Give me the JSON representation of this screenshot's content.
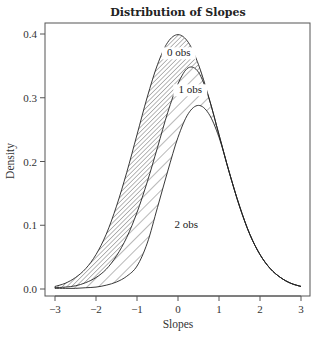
{
  "chart_data": {
    "type": "area",
    "title": "Distribution of Slopes",
    "xlabel": "Slopes",
    "ylabel": "Density",
    "xlim": [
      -3.25,
      3.2
    ],
    "ylim": [
      -0.005,
      0.415
    ],
    "xticks": [
      -3,
      -2,
      -1,
      0,
      1,
      2,
      3
    ],
    "xtick_labels": [
      "−3",
      "−2",
      "−1",
      "0",
      "1",
      "2",
      "3"
    ],
    "yticks": [
      0.0,
      0.1,
      0.2,
      0.3,
      0.4
    ],
    "ytick_labels": [
      "0.0",
      "0.1",
      "0.2",
      "0.3",
      "0.4"
    ],
    "grid": false,
    "legend": "none (inline curve labels)",
    "x": [
      -3,
      -2.75,
      -2.5,
      -2.25,
      -2,
      -1.75,
      -1.5,
      -1.25,
      -1,
      -0.75,
      -0.5,
      -0.25,
      0,
      0.25,
      0.5,
      0.75,
      1,
      1.25,
      1.5,
      1.75,
      2,
      2.25,
      2.5,
      2.75,
      3
    ],
    "series": [
      {
        "name": "0 obs",
        "label_pos": [
          0.02,
          0.365
        ],
        "values": [
          0.004,
          0.009,
          0.018,
          0.032,
          0.054,
          0.086,
          0.13,
          0.183,
          0.242,
          0.301,
          0.352,
          0.387,
          0.399,
          0.387,
          0.352,
          0.301,
          0.242,
          0.183,
          0.13,
          0.086,
          0.054,
          0.032,
          0.018,
          0.009,
          0.004
        ]
      },
      {
        "name": "1 obs",
        "label_pos": [
          0.3,
          0.307
        ],
        "values": [
          0.002,
          0.003,
          0.005,
          0.01,
          0.018,
          0.031,
          0.052,
          0.081,
          0.12,
          0.168,
          0.222,
          0.277,
          0.322,
          0.347,
          0.34,
          0.3,
          0.242,
          0.183,
          0.13,
          0.086,
          0.054,
          0.032,
          0.018,
          0.009,
          0.004
        ]
      },
      {
        "name": "2 obs",
        "label_pos": [
          0.2,
          0.095
        ],
        "values": [
          0.001,
          0.001,
          0.001,
          0.002,
          0.003,
          0.006,
          0.011,
          0.02,
          0.036,
          0.072,
          0.128,
          0.185,
          0.238,
          0.275,
          0.288,
          0.275,
          0.238,
          0.183,
          0.13,
          0.086,
          0.054,
          0.032,
          0.018,
          0.009,
          0.004
        ]
      }
    ],
    "shading": [
      {
        "between": [
          "0 obs",
          "1 obs"
        ],
        "pattern": "dense diagonal hatch"
      },
      {
        "between": [
          "1 obs",
          "2 obs"
        ],
        "pattern": "sparse diagonal hatch"
      }
    ]
  }
}
